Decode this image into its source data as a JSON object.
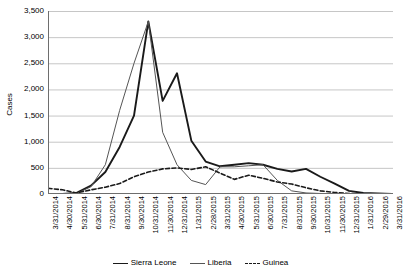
{
  "chart_data": {
    "type": "line",
    "title": "",
    "xlabel": "",
    "ylabel": "Cases",
    "ylim": [
      0,
      3500
    ],
    "ytick_values": [
      0,
      500,
      1000,
      1500,
      2000,
      2500,
      3000,
      3500
    ],
    "ytick_labels": [
      "0",
      "500",
      "1,000",
      "1,500",
      "2,000",
      "2,500",
      "3,000",
      "3,500"
    ],
    "grid": true,
    "legend_position": "bottom",
    "categories": [
      "3/31/2014",
      "4/30/2014",
      "5/31/2014",
      "6/30/2014",
      "7/31/2014",
      "8/31/2014",
      "9/30/2014",
      "10/31/2014",
      "11/30/2014",
      "12/31/2014",
      "1/31/2015",
      "2/28/2015",
      "3/31/2015",
      "4/30/2015",
      "5/31/2015",
      "6/30/2015",
      "7/31/2015",
      "8/31/2015",
      "9/30/2015",
      "10/31/2015",
      "11/30/2015",
      "12/31/2015",
      "1/31/2016",
      "2/29/2016",
      "3/31/2016"
    ],
    "series": [
      {
        "name": "Sierra Leone",
        "style": "solid-thick",
        "color": "#1a1a1a",
        "values": [
          0,
          0,
          20,
          160,
          420,
          900,
          1500,
          3300,
          1780,
          2310,
          1020,
          620,
          530,
          560,
          590,
          560,
          480,
          430,
          480,
          330,
          200,
          60,
          20,
          10,
          0
        ]
      },
      {
        "name": "Liberia",
        "style": "solid-thin",
        "color": "#555555",
        "values": [
          0,
          0,
          10,
          140,
          560,
          1600,
          2500,
          3300,
          1180,
          560,
          260,
          180,
          520,
          520,
          540,
          560,
          260,
          60,
          20,
          10,
          0,
          0,
          0,
          0,
          0
        ]
      },
      {
        "name": "Guinea",
        "style": "dashed",
        "color": "#1a1a1a",
        "values": [
          110,
          80,
          20,
          80,
          130,
          200,
          330,
          420,
          480,
          500,
          470,
          520,
          400,
          280,
          360,
          300,
          230,
          190,
          120,
          60,
          30,
          10,
          0,
          0,
          0
        ]
      }
    ]
  },
  "legend": {
    "items": [
      {
        "label": "Sierra Leone"
      },
      {
        "label": "Liberia"
      },
      {
        "label": "Guinea"
      }
    ]
  }
}
